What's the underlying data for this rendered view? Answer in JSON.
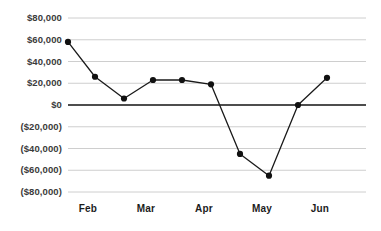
{
  "chart_data": {
    "type": "line",
    "title": "",
    "subtitle": "",
    "xlabel": "",
    "ylabel": "",
    "grid": true,
    "legend": false,
    "legend_position": "none",
    "x_tick_labels": [
      "Feb",
      "Mar",
      "Apr",
      "May",
      "Jun"
    ],
    "y_tick_labels": [
      "$80,000",
      "$60,000",
      "$40,000",
      "$20,000",
      "$0",
      "($20,000)",
      "($40,000)",
      "($60,000)",
      "($80,000)"
    ],
    "y_tick_values": [
      80000,
      60000,
      40000,
      20000,
      0,
      -20000,
      -40000,
      -60000,
      -80000
    ],
    "ylim": [
      -80000,
      80000
    ],
    "zero_line": 0,
    "x": [
      0,
      1,
      2,
      3,
      4,
      5,
      6,
      7,
      8,
      9
    ],
    "values": [
      58000,
      26000,
      6000,
      23000,
      23000,
      19000,
      -45000,
      -65000,
      0,
      25000
    ],
    "series": [
      {
        "name": "Series 1",
        "values": [
          58000,
          26000,
          6000,
          23000,
          23000,
          19000,
          -45000,
          -65000,
          0,
          25000
        ]
      }
    ],
    "colors": {
      "line": "#1a1a1a",
      "marker": "#111111",
      "grid": "#c8c8c8",
      "zero_axis": "#4d4d4d",
      "tick_text": "#3b3b3b",
      "month_text": "#1c1c1c",
      "background": "#ffffff"
    },
    "marker_shape": "circle",
    "marker_radius": 3.1,
    "line_width": 1.3
  },
  "geometry": {
    "plot_left": 68,
    "plot_right": 366,
    "plot_top": 18,
    "plot_bottom": 192,
    "y_label_right_edge": 62,
    "x_label_y": 203,
    "month_x_positions": [
      88,
      146,
      204,
      262,
      320
    ],
    "point_x_positions": [
      61,
      88,
      117,
      146,
      175,
      204,
      233,
      262,
      291,
      320
    ],
    "point_x_offset": 7
  }
}
